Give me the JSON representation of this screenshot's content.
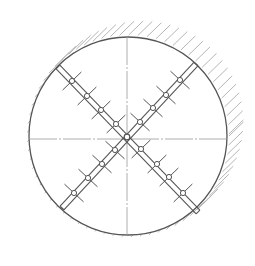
{
  "diagram": {
    "title": "",
    "type": "tunnel-cross-section-with-cross-bracing",
    "canvas": {
      "width": 255,
      "height": 266
    },
    "colors": {
      "line": "#555555",
      "hatch": "#b5b5b5",
      "centerline": "#9a9a9a",
      "background": "#ffffff"
    },
    "circle": {
      "cx": 128,
      "cy": 136,
      "r": 99
    },
    "centerlines": {
      "horizontal_y": 139,
      "vertical_x": 127
    },
    "bars": [
      {
        "name": "bar-tl-br",
        "x1": 58,
        "y1": 67,
        "x2": 198,
        "y2": 212,
        "joints": [
          [
            72,
            81
          ],
          [
            87,
            96
          ],
          [
            101,
            110
          ],
          [
            116,
            124
          ],
          [
            141,
            149
          ],
          [
            157,
            164
          ],
          [
            169,
            177
          ],
          [
            183,
            193
          ]
        ]
      },
      {
        "name": "bar-tr-bl",
        "x1": 196,
        "y1": 64,
        "x2": 62,
        "y2": 208,
        "joints": [
          [
            180,
            80
          ],
          [
            166,
            95
          ],
          [
            153,
            108
          ],
          [
            140,
            122
          ],
          [
            115,
            150
          ],
          [
            102,
            164
          ],
          [
            88,
            178
          ],
          [
            74,
            193
          ]
        ]
      }
    ],
    "center_joint": [
      127,
      137
    ],
    "labels": []
  }
}
